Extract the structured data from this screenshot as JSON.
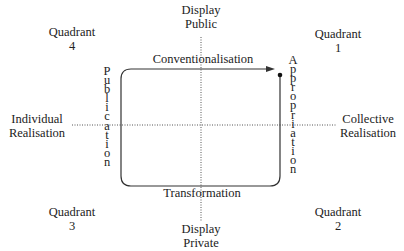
{
  "axes": {
    "top": {
      "line1": "Display",
      "line2": "Public"
    },
    "bottom": {
      "line1": "Display",
      "line2": "Private"
    },
    "left": {
      "line1": "Individual",
      "line2": "Realisation"
    },
    "right": {
      "line1": "Collective",
      "line2": "Realisation"
    }
  },
  "quadrants": {
    "q1": {
      "line1": "Quadrant",
      "line2": "1"
    },
    "q2": {
      "line1": "Quadrant",
      "line2": "2"
    },
    "q3": {
      "line1": "Quadrant",
      "line2": "3"
    },
    "q4": {
      "line1": "Quadrant",
      "line2": "4"
    }
  },
  "cycle": {
    "top": "Conventionalisation",
    "bottom": "Transformation",
    "left": "Publication",
    "right": "Appropriation"
  },
  "colors": {
    "line": "#333333",
    "dotted": "#555555",
    "text": "#222222"
  }
}
